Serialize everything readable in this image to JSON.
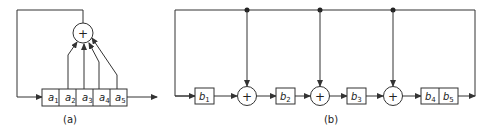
{
  "diagram_a": {
    "caption": "(a)",
    "register_cells": [
      {
        "var": "a",
        "sub": "1"
      },
      {
        "var": "a",
        "sub": "2"
      },
      {
        "var": "a",
        "sub": "3"
      },
      {
        "var": "a",
        "sub": "4"
      },
      {
        "var": "a",
        "sub": "5"
      }
    ],
    "adder_symbol": "+"
  },
  "diagram_b": {
    "caption": "(b)",
    "stages": [
      {
        "var": "b",
        "sub": "1"
      },
      {
        "var": "b",
        "sub": "2"
      },
      {
        "var": "b",
        "sub": "3"
      },
      {
        "var": "b",
        "sub": "4"
      },
      {
        "var": "b",
        "sub": "5"
      }
    ],
    "adder_symbol": "+"
  }
}
